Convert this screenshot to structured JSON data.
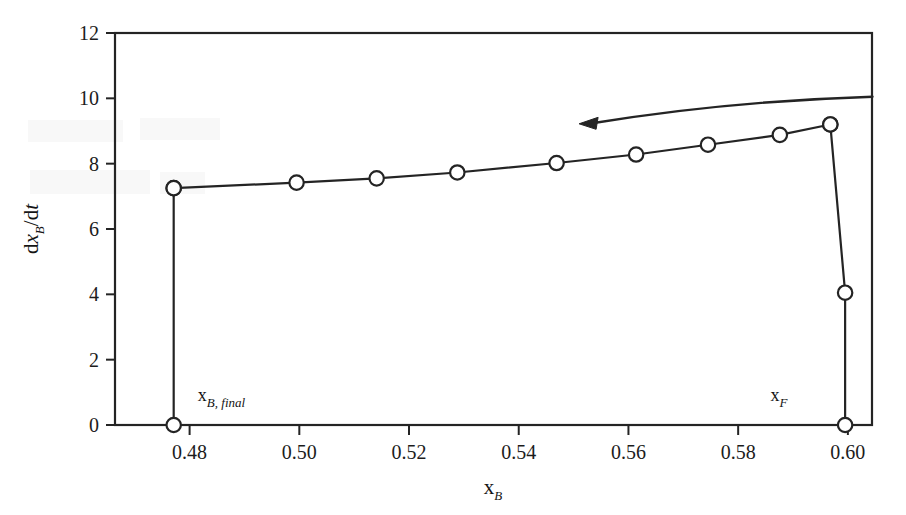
{
  "figure": {
    "background_color": "#ffffff",
    "line_color": "#242424",
    "marker_fill": "#ffffff"
  },
  "chart_data": {
    "type": "line",
    "title": "",
    "subtitle": "",
    "xlabel": "x_B",
    "xlabel_base": "x",
    "xlabel_sub": "B",
    "ylabel": "dx_B/dt",
    "ylabel_parts": {
      "d1": "d",
      "x": "x",
      "sub": "B",
      "slash": "/d",
      "t": "t"
    },
    "xlim": [
      0.4664,
      0.6044
    ],
    "ylim": [
      0,
      12
    ],
    "grid": false,
    "legend": null,
    "xticks": [
      0.48,
      0.5,
      0.52,
      0.54,
      0.56,
      0.58,
      0.6
    ],
    "xtick_labels": [
      "0.48",
      "0.50",
      "0.52",
      "0.54",
      "0.56",
      "0.58",
      "0.60"
    ],
    "yticks": [
      0,
      2,
      4,
      6,
      8,
      10,
      12
    ],
    "ytick_labels": [
      "0",
      "2",
      "4",
      "6",
      "8",
      "10",
      "12"
    ],
    "series": [
      {
        "name": "dxB/dt curve",
        "marker": "open-circle",
        "x": [
          0.4771,
          0.4995,
          0.5141,
          0.5288,
          0.5469,
          0.5614,
          0.5745,
          0.5876,
          0.5968
        ],
        "y": [
          7.25,
          7.42,
          7.55,
          7.73,
          8.02,
          8.28,
          8.58,
          8.88,
          9.2
        ]
      },
      {
        "name": "feed drop segment",
        "marker": "open-circle",
        "x": [
          0.5968,
          0.5995,
          0.5995
        ],
        "y": [
          9.2,
          4.05,
          0.0
        ]
      },
      {
        "name": "final bottoms drop segment",
        "marker": "open-circle",
        "x": [
          0.4771,
          0.4771
        ],
        "y": [
          7.25,
          0.0
        ]
      }
    ],
    "annotations": [
      {
        "name": "x_B,final",
        "base": "x",
        "sub": "B, final",
        "x": 0.4771,
        "y": 0.0,
        "text_x": 0.4815,
        "text_y": 0.72
      },
      {
        "name": "x_F",
        "base": "x",
        "sub": "F",
        "x": 0.5995,
        "y": 0.0,
        "text_x": 0.589,
        "text_y": 0.72
      },
      {
        "name": "direction-arrow",
        "type": "curved-arrow",
        "direction": "left",
        "from_x": 0.6045,
        "from_y": 10.05,
        "to_x": 0.551,
        "to_y": 9.22
      }
    ]
  }
}
